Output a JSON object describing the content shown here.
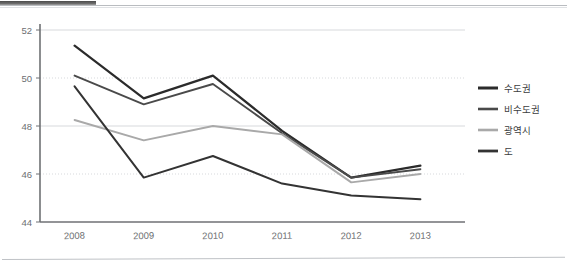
{
  "chart_data": {
    "type": "line",
    "title": "",
    "subtitle": "",
    "xlabel": "",
    "ylabel": "",
    "categories": [
      "2008",
      "2009",
      "2010",
      "2011",
      "2012",
      "2013"
    ],
    "x": [
      2008,
      2009,
      2010,
      2011,
      2012,
      2013
    ],
    "ylim": [
      44,
      52
    ],
    "yticks": [
      44,
      46,
      48,
      50,
      52
    ],
    "ytick_labels": [
      "44",
      "46",
      "48",
      "50",
      "52"
    ],
    "grid": "horizontal-dotted",
    "legend_position": "right",
    "series": [
      {
        "name": "수도권",
        "color": "#2b2b2b",
        "width": 2.2,
        "values": [
          51.35,
          49.15,
          50.1,
          47.8,
          45.85,
          46.35
        ]
      },
      {
        "name": "비수도권",
        "color": "#4a4a4a",
        "width": 1.9,
        "values": [
          50.1,
          48.9,
          49.75,
          47.7,
          45.85,
          46.2
        ]
      },
      {
        "name": "광역시",
        "color": "#a9a9a9",
        "width": 1.9,
        "values": [
          48.25,
          47.4,
          48.0,
          47.65,
          45.65,
          46.0
        ]
      },
      {
        "name": "도",
        "color": "#333333",
        "width": 2.0,
        "values": [
          49.65,
          45.85,
          46.75,
          45.6,
          45.1,
          44.95
        ]
      }
    ]
  },
  "axes": {
    "y_axis_name": "value-axis",
    "x_axis_name": "year-axis",
    "axis_color": "#6f7174",
    "grid_color": "#d7d9dc"
  },
  "legend": {
    "items": [
      {
        "label": "수도권",
        "color": "#2b2b2b",
        "thickness": 3.0
      },
      {
        "label": "비수도권",
        "color": "#4a4a4a",
        "thickness": 2.6
      },
      {
        "label": "광역시",
        "color": "#a9a9a9",
        "thickness": 2.6
      },
      {
        "label": "도",
        "color": "#333333",
        "thickness": 2.8
      }
    ]
  }
}
